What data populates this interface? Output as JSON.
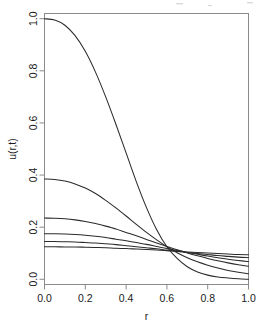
{
  "chart_data": {
    "type": "line",
    "title": "",
    "subtitle": "",
    "xlabel": "r",
    "ylabel": "u(r,t)",
    "xlim": [
      0.0,
      1.0
    ],
    "ylim": [
      -0.02,
      1.02
    ],
    "grid": false,
    "legend": "none",
    "background": "#ffffff",
    "curve_color": "#2b2b2b",
    "frame_color": "#8a8a8a",
    "xticks": [
      0.0,
      0.2,
      0.4,
      0.6,
      0.8,
      1.0
    ],
    "xtick_labels": [
      "0.0",
      "0.2",
      "0.4",
      "0.6",
      "0.8",
      "1.0"
    ],
    "yticks": [
      0.0,
      0.2,
      0.4,
      0.6,
      0.8,
      1.0
    ],
    "ytick_labels": [
      "0.0",
      "0.2",
      "0.4",
      "0.6",
      "0.8",
      "1.0"
    ],
    "x": [
      0.0,
      0.05,
      0.1,
      0.15,
      0.2,
      0.25,
      0.3,
      0.35,
      0.4,
      0.45,
      0.5,
      0.55,
      0.6,
      0.65,
      0.7,
      0.75,
      0.8,
      0.85,
      0.9,
      0.95,
      1.0
    ],
    "series": [
      {
        "name": "t1",
        "values": [
          1.0,
          0.995,
          0.975,
          0.935,
          0.875,
          0.795,
          0.7,
          0.595,
          0.485,
          0.375,
          0.275,
          0.19,
          0.125,
          0.08,
          0.048,
          0.028,
          0.016,
          0.009,
          0.005,
          0.002,
          0.0
        ]
      },
      {
        "name": "t2",
        "values": [
          0.385,
          0.383,
          0.377,
          0.366,
          0.35,
          0.329,
          0.303,
          0.274,
          0.243,
          0.211,
          0.18,
          0.151,
          0.125,
          0.102,
          0.083,
          0.067,
          0.054,
          0.043,
          0.034,
          0.027,
          0.021
        ]
      },
      {
        "name": "t3",
        "values": [
          0.235,
          0.234,
          0.232,
          0.228,
          0.222,
          0.214,
          0.204,
          0.193,
          0.18,
          0.167,
          0.153,
          0.139,
          0.126,
          0.113,
          0.101,
          0.09,
          0.08,
          0.071,
          0.063,
          0.056,
          0.05
        ]
      },
      {
        "name": "t4",
        "values": [
          0.175,
          0.175,
          0.174,
          0.172,
          0.169,
          0.165,
          0.16,
          0.154,
          0.148,
          0.141,
          0.134,
          0.126,
          0.118,
          0.111,
          0.103,
          0.096,
          0.089,
          0.083,
          0.077,
          0.072,
          0.068
        ]
      },
      {
        "name": "t5",
        "values": [
          0.145,
          0.145,
          0.144,
          0.143,
          0.141,
          0.139,
          0.136,
          0.133,
          0.129,
          0.125,
          0.121,
          0.117,
          0.112,
          0.108,
          0.103,
          0.099,
          0.095,
          0.091,
          0.088,
          0.085,
          0.083
        ]
      },
      {
        "name": "t6",
        "values": [
          0.125,
          0.125,
          0.124,
          0.124,
          0.123,
          0.122,
          0.121,
          0.119,
          0.118,
          0.116,
          0.114,
          0.112,
          0.11,
          0.107,
          0.105,
          0.103,
          0.101,
          0.099,
          0.097,
          0.095,
          0.094
        ]
      }
    ]
  }
}
